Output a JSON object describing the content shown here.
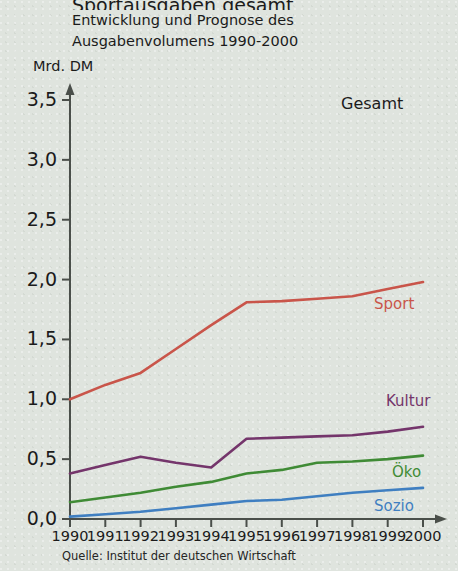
{
  "header": {
    "title_main": "Sportausgaben gesamt",
    "title_line1": "Entwicklung und Prognose des",
    "title_line2": "Ausgabenvolumens 1990-2000",
    "y_axis_unit": "Mrd. DM",
    "corner_label": "Gesamt"
  },
  "footer": {
    "source": "Quelle: Institut der deutschen Wirtschaft"
  },
  "colors": {
    "background": "#dfe4de",
    "axis": "#4a4f4a",
    "sport": "#c9554a",
    "kultur": "#74356b",
    "oeko": "#3f8b35",
    "sozio": "#3f7fc1",
    "text": "#1b1b1b"
  },
  "chart_data": {
    "type": "line",
    "title": "Sportausgaben gesamt",
    "subtitle": "Entwicklung und Prognose des Ausgabenvolumens 1990-2000",
    "xlabel": "",
    "ylabel": "Mrd. DM",
    "ylim": [
      0.0,
      3.5
    ],
    "yticks": [
      "0,0",
      "0,5",
      "1,0",
      "1,5",
      "2,0",
      "2,5",
      "3,0",
      "3,5"
    ],
    "ytick_values": [
      0.0,
      0.5,
      1.0,
      1.5,
      2.0,
      2.5,
      3.0,
      3.5
    ],
    "grid": false,
    "legend": "inline-right",
    "categories": [
      "1990",
      "1991",
      "1992",
      "1993",
      "1994",
      "1995",
      "1996",
      "1997",
      "1998",
      "1999",
      "2000"
    ],
    "x": [
      1990,
      1991,
      1992,
      1993,
      1994,
      1995,
      1996,
      1997,
      1998,
      1999,
      2000
    ],
    "series": [
      {
        "name": "Sport",
        "color": "#c9554a",
        "values": [
          1.0,
          1.12,
          1.22,
          1.42,
          1.62,
          1.81,
          1.82,
          1.84,
          1.86,
          1.92,
          1.98
        ]
      },
      {
        "name": "Kultur",
        "color": "#74356b",
        "values": [
          0.38,
          0.45,
          0.52,
          0.47,
          0.43,
          0.67,
          0.68,
          0.69,
          0.7,
          0.73,
          0.77
        ]
      },
      {
        "name": "Öko",
        "color": "#3f8b35",
        "values": [
          0.14,
          0.18,
          0.22,
          0.27,
          0.31,
          0.38,
          0.41,
          0.47,
          0.48,
          0.5,
          0.53
        ]
      },
      {
        "name": "Sozio",
        "color": "#3f7fc1",
        "values": [
          0.02,
          0.04,
          0.06,
          0.09,
          0.12,
          0.15,
          0.16,
          0.19,
          0.22,
          0.24,
          0.26
        ]
      }
    ]
  }
}
